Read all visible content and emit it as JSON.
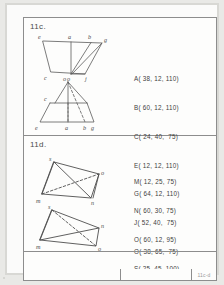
{
  "document": {
    "type": "technical-drawing-worksheet"
  },
  "panels": [
    {
      "label": "11c.",
      "figures": [
        {
          "name": "upper-trapezoid",
          "vertices": [
            "e",
            "a",
            "b",
            "g",
            "c",
            "o",
            "j"
          ]
        },
        {
          "name": "lower-trapezoid",
          "vertices": [
            "o",
            "c",
            "e",
            "a",
            "b",
            "g"
          ]
        }
      ],
      "coordinates": [
        "A( 38, 12, 110)",
        "B( 60, 12, 110)",
        "C( 24, 40,  75)",
        "E( 12, 12, 110)",
        "G( 64, 12, 110)",
        "J( 52, 40,  75)",
        "O( 38, 65,  75)"
      ]
    },
    {
      "label": "11d.",
      "figures": [
        {
          "name": "upper-quadrilateral",
          "vertices": [
            "s",
            "o",
            "m",
            "n"
          ]
        },
        {
          "name": "lower-quadrilateral",
          "vertices": [
            "s",
            "o",
            "m",
            "n"
          ]
        }
      ],
      "coordinates": [
        "M( 12, 25, 75)",
        "N( 60, 30, 75)",
        "O( 60, 12, 95)",
        "S( 25, 45, 100)"
      ]
    }
  ],
  "titleblock": {
    "code": "11c-d"
  }
}
